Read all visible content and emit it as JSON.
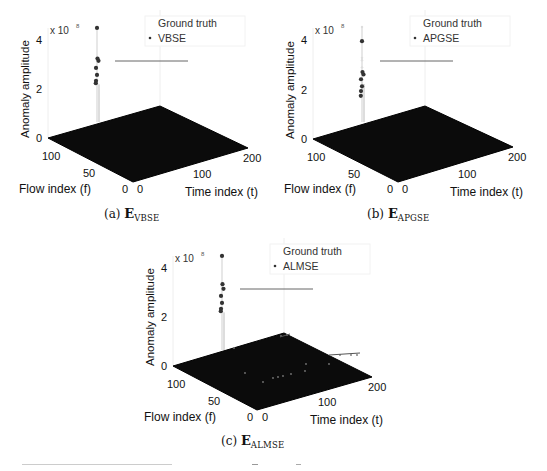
{
  "figure": {
    "panels": [
      {
        "id": "a",
        "caption_prefix": "(a)",
        "caption_symbol": "E",
        "caption_subscript": "VBSE",
        "legend": [
          "Ground truth",
          "VBSE"
        ]
      },
      {
        "id": "b",
        "caption_prefix": "(b)",
        "caption_symbol": "E",
        "caption_subscript": "APGSE",
        "legend": [
          "Ground truth",
          "APGSE"
        ]
      },
      {
        "id": "c",
        "caption_prefix": "(c)",
        "caption_symbol": "E",
        "caption_subscript": "ALMSE",
        "legend": [
          "Ground truth",
          "ALMSE"
        ]
      }
    ],
    "axes": {
      "z_label": "Anomaly amplitude",
      "z_multiplier": "x 10",
      "z_exponent": "8",
      "z_ticks": [
        "0",
        "2",
        "4"
      ],
      "flow_label": "Flow index (f)",
      "flow_ticks": [
        "0",
        "50",
        "100"
      ],
      "time_label": "Time index (t)",
      "time_ticks": [
        "0",
        "100",
        "200"
      ]
    }
  },
  "chart_data": [
    {
      "type": "scatter",
      "subtype": "3d-stem",
      "title": "(a) E_VBSE",
      "xlabel": "Time index (t)",
      "ylabel": "Flow index (f)",
      "zlabel": "Anomaly amplitude",
      "z_scale": "x 10^8",
      "xlim": [
        0,
        200
      ],
      "ylim": [
        0,
        121
      ],
      "zlim": [
        0,
        4
      ],
      "xticks": [
        0,
        100,
        200
      ],
      "yticks": [
        0,
        50,
        100
      ],
      "zticks": [
        0,
        2,
        4
      ],
      "legend": [
        "Ground truth",
        "VBSE"
      ],
      "legend_position": "upper right",
      "series": [
        {
          "name": "Ground truth",
          "z_values": [
            4.0,
            2.7,
            2.6,
            2.3,
            2.0,
            1.75,
            1.65
          ]
        },
        {
          "name": "VBSE",
          "z_values": [
            4.0,
            2.7,
            2.6,
            2.3,
            2.0,
            1.75,
            1.65
          ]
        }
      ],
      "note": "Anomalies concentrated at one location; all other entries near 0 (dark plane)."
    },
    {
      "type": "scatter",
      "subtype": "3d-stem",
      "title": "(b) E_APGSE",
      "xlabel": "Time index (t)",
      "ylabel": "Flow index (f)",
      "zlabel": "Anomaly amplitude",
      "z_scale": "x 10^8",
      "xlim": [
        0,
        200
      ],
      "ylim": [
        0,
        121
      ],
      "zlim": [
        0,
        4
      ],
      "xticks": [
        0,
        100,
        200
      ],
      "yticks": [
        0,
        50,
        100
      ],
      "zticks": [
        0,
        2,
        4
      ],
      "legend": [
        "Ground truth",
        "APGSE"
      ],
      "legend_position": "upper right",
      "series": [
        {
          "name": "Ground truth",
          "z_values": [
            4.0,
            2.7,
            2.6,
            2.3,
            2.0,
            1.75,
            1.65
          ]
        },
        {
          "name": "APGSE",
          "z_values": [
            3.4,
            2.1,
            2.0,
            1.8,
            1.5,
            1.3,
            1.1
          ]
        }
      ],
      "note": "Estimates underestimate ground truth amplitudes."
    },
    {
      "type": "scatter",
      "subtype": "3d-stem",
      "title": "(c) E_ALMSE",
      "xlabel": "Time index (t)",
      "ylabel": "Flow index (f)",
      "zlabel": "Anomaly amplitude",
      "z_scale": "x 10^8",
      "xlim": [
        0,
        200
      ],
      "ylim": [
        0,
        121
      ],
      "zlim": [
        0,
        4
      ],
      "xticks": [
        0,
        100,
        200
      ],
      "yticks": [
        0,
        50,
        100
      ],
      "zticks": [
        0,
        2,
        4
      ],
      "legend": [
        "Ground truth",
        "ALMSE"
      ],
      "legend_position": "upper right",
      "series": [
        {
          "name": "Ground truth",
          "z_values": [
            4.0,
            2.7,
            2.6,
            2.3,
            2.0,
            1.75,
            1.65
          ]
        },
        {
          "name": "ALMSE",
          "z_values": [
            4.0,
            2.8,
            2.6,
            2.3,
            2.0,
            1.75,
            1.65
          ]
        }
      ],
      "note": "Additional small spurious points scattered across the plane."
    }
  ]
}
